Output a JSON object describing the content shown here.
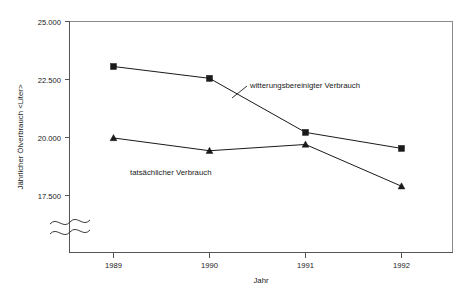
{
  "chart_data": {
    "type": "line",
    "title": "",
    "xlabel": "Jahr",
    "ylabel": "Jährlicher Ölverbrauch <Liter>",
    "categories": [
      "1989",
      "1990",
      "1991",
      "1992"
    ],
    "x": [
      1989,
      1990,
      1991,
      1992
    ],
    "ylim": [
      17500,
      25000
    ],
    "yticks": [
      17500,
      20000,
      22500,
      25000
    ],
    "ytick_labels": [
      "17.500",
      "20.000",
      "22.500",
      "25.000"
    ],
    "xtick_labels": [
      "1989",
      "1990",
      "1991",
      "1992"
    ],
    "grid": false,
    "legend_position": "inline-annotation",
    "y_axis_break": true,
    "y_axis_break_note": "Wellenlinie / Achsenunterbrechung unterhalb 17.500",
    "series": [
      {
        "name": "witterungsbereinigter Verbrauch",
        "marker": "square",
        "values": [
          23060,
          22550,
          20220,
          19530
        ],
        "color": "#1a1a1a"
      },
      {
        "name": "tatsächlicher Verbrauch",
        "marker": "triangle",
        "values": [
          19980,
          19430,
          19700,
          17900
        ],
        "color": "#1a1a1a"
      }
    ],
    "annotations": [
      {
        "text": "witterungsbereinigter Verbrauch",
        "series": "witterungsbereinigter Verbrauch"
      },
      {
        "text": "tatsächlicher Verbrauch",
        "series": "tatsächlicher Verbrauch"
      }
    ]
  },
  "axes": {
    "y_title": "Jährlicher Ölverbrauch <Liter>",
    "x_title": "Jahr",
    "y_ticks": [
      {
        "label": "25.000"
      },
      {
        "label": "22.500"
      },
      {
        "label": "20.000"
      },
      {
        "label": "17.500"
      }
    ],
    "x_ticks": [
      {
        "label": "1989"
      },
      {
        "label": "1990"
      },
      {
        "label": "1991"
      },
      {
        "label": "1992"
      }
    ]
  },
  "annotations": {
    "upper": "witterungsbereinigter Verbrauch",
    "lower": "tatsächlicher Verbrauch"
  },
  "colors": {
    "ink": "#1a1a1a",
    "axis": "#555555",
    "frame": "#8a8a8a",
    "background": "#ffffff"
  }
}
